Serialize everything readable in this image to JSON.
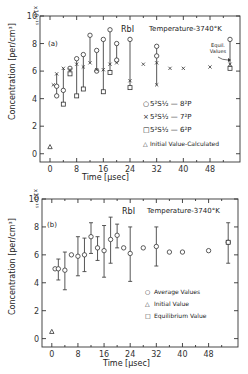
{
  "chart_data": [
    {
      "type": "scatter",
      "panel_label": "(a)",
      "title": "RbI",
      "subtitle": "Temperature-3740°K",
      "xlabel": "Time [µsec]",
      "ylabel": "Concentration [per/cm³]",
      "y_multiplier": "x10^15",
      "xlim": [
        -3,
        57
      ],
      "ylim": [
        -0.6,
        10
      ],
      "x_ticks": [
        0,
        8,
        16,
        24,
        32,
        40,
        48
      ],
      "y_ticks": [
        0,
        2,
        4,
        6,
        8,
        10
      ],
      "annotation": "Equil. Values",
      "legend": [
        "5²S½—8²P",
        "5²S½—7²P",
        "5²S½—6²P",
        "Initial Value-Calculated"
      ],
      "series": [
        {
          "name": "5²S½—8²P",
          "marker": "circle",
          "points": [
            [
              2,
              4.9
            ],
            [
              2,
              4.2
            ],
            [
              4,
              4.6
            ],
            [
              6,
              6.2
            ],
            [
              8,
              6.9
            ],
            [
              10,
              7.2
            ],
            [
              12,
              8.6
            ],
            [
              14,
              7.5
            ],
            [
              14,
              6.0
            ],
            [
              16,
              8.3
            ],
            [
              18,
              9.0
            ],
            [
              20,
              8.0
            ],
            [
              20,
              6.8
            ],
            [
              24,
              8.3
            ],
            [
              32,
              7.8
            ],
            [
              32,
              7.1
            ],
            [
              54,
              8.3
            ]
          ]
        },
        {
          "name": "5²S½—7²P",
          "marker": "x",
          "points": [
            [
              1,
              5.0
            ],
            [
              2,
              5.8
            ],
            [
              4,
              6.2
            ],
            [
              6,
              6.1
            ],
            [
              8,
              6.5
            ],
            [
              10,
              6.3
            ],
            [
              12,
              6.6
            ],
            [
              14,
              6.1
            ],
            [
              16,
              6.1
            ],
            [
              18,
              6.5
            ],
            [
              20,
              6.6
            ],
            [
              24,
              5.3
            ],
            [
              28,
              6.5
            ],
            [
              32,
              6.6
            ],
            [
              32,
              5.0
            ],
            [
              36,
              6.2
            ],
            [
              40,
              6.2
            ],
            [
              48,
              6.3
            ],
            [
              54,
              6.5
            ]
          ]
        },
        {
          "name": "5²S½—6²P",
          "marker": "square",
          "points": [
            [
              4,
              3.6
            ],
            [
              6,
              5.8
            ],
            [
              8,
              4.2
            ],
            [
              10,
              4.7
            ],
            [
              16,
              4.5
            ],
            [
              18,
              5.9
            ],
            [
              24,
              4.8
            ],
            [
              54,
              6.2
            ]
          ]
        },
        {
          "name": "Initial Value-Calculated",
          "marker": "triangle",
          "points": [
            [
              0,
              0.5
            ]
          ]
        }
      ],
      "ranges": [
        [
          2,
          4.2,
          5.8
        ],
        [
          4,
          3.6,
          6.2
        ],
        [
          6,
          5.8,
          6.2
        ],
        [
          8,
          4.2,
          6.9
        ],
        [
          10,
          4.7,
          7.2
        ],
        [
          12,
          6.6,
          8.6
        ],
        [
          14,
          6.0,
          7.5
        ],
        [
          16,
          4.5,
          8.3
        ],
        [
          18,
          5.9,
          9.0
        ],
        [
          20,
          6.6,
          8.0
        ],
        [
          24,
          4.8,
          8.3
        ],
        [
          32,
          5.0,
          7.8
        ],
        [
          54,
          6.2,
          8.3
        ]
      ]
    },
    {
      "type": "scatter",
      "panel_label": "(b)",
      "title": "RbI",
      "subtitle": "Temperature-3740°K",
      "xlabel": "Time [µsec]",
      "ylabel": "Concentration [per/cm³]",
      "y_multiplier": "x10^15",
      "xlim": [
        -3,
        57
      ],
      "ylim": [
        -0.6,
        10
      ],
      "x_ticks": [
        0,
        8,
        16,
        24,
        32,
        40,
        48
      ],
      "y_ticks": [
        0,
        2,
        4,
        6,
        8,
        10
      ],
      "legend": [
        "Average Values",
        "Initial Value",
        "Equilibrium Value"
      ],
      "series": [
        {
          "name": "Average Values",
          "marker": "circle",
          "points": [
            [
              1,
              5.0
            ],
            [
              2,
              5.0
            ],
            [
              4,
              4.9
            ],
            [
              6,
              6.0
            ],
            [
              8,
              5.9
            ],
            [
              10,
              6.0
            ],
            [
              12,
              7.3
            ],
            [
              14,
              6.5
            ],
            [
              16,
              6.3
            ],
            [
              18,
              7.1
            ],
            [
              20,
              7.4
            ],
            [
              22,
              6.5
            ],
            [
              24,
              6.1
            ],
            [
              28,
              6.5
            ],
            [
              32,
              6.6
            ],
            [
              36,
              6.2
            ],
            [
              40,
              6.2
            ],
            [
              48,
              6.3
            ],
            [
              54,
              6.9
            ]
          ]
        },
        {
          "name": "Initial Value",
          "marker": "triangle",
          "points": [
            [
              0,
              0.5
            ]
          ]
        },
        {
          "name": "Equilibrium Value",
          "marker": "square",
          "points": [
            [
              54,
              6.9
            ]
          ]
        }
      ],
      "error_bars": [
        [
          2,
          4.2,
          5.7
        ],
        [
          4,
          3.5,
          6.2
        ],
        [
          8,
          4.5,
          7.3
        ],
        [
          10,
          4.8,
          7.2
        ],
        [
          12,
          6.1,
          8.3
        ],
        [
          14,
          5.6,
          7.3
        ],
        [
          16,
          4.4,
          8.1
        ],
        [
          18,
          5.4,
          8.7
        ],
        [
          20,
          6.5,
          8.2
        ],
        [
          24,
          4.1,
          8.0
        ],
        [
          32,
          5.2,
          8.0
        ],
        [
          54,
          5.4,
          8.3
        ]
      ]
    }
  ],
  "labels": {
    "a": {
      "panel": "(a)",
      "title": "RbI",
      "temp": "Temperature-3740°K",
      "mult": "x10⁻¹⁵",
      "ylabel": "Concentration [per/cm³]",
      "xlabel": "Time [µsec]",
      "equil": "Equil. Values",
      "legend": [
        "5²S½ — 8²P",
        "5²S½ — 7²P",
        "5²S½ — 6²P",
        "Initial Value-Calculated"
      ]
    },
    "b": {
      "panel": "(b)",
      "title": "RbI",
      "temp": "Temperature-3740°K",
      "mult": "x10⁻¹⁵",
      "ylabel": "Concentration [per/cm³]",
      "xlabel": "Time [µsec]",
      "legend": [
        "Average Values",
        "Initial Value",
        "Equilibrium Value"
      ]
    },
    "xticks": [
      "0",
      "8",
      "16",
      "24",
      "32",
      "40",
      "48"
    ],
    "yticks": [
      "0",
      "2",
      "4",
      "6",
      "8",
      "10"
    ]
  }
}
